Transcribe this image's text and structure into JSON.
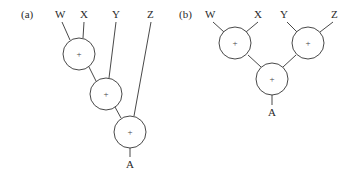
{
  "panels": [
    {
      "id": "a",
      "tag": "(a)",
      "tag_pos": [
        21,
        18
      ],
      "inputs": [
        {
          "label": "W",
          "x": 58,
          "y": 18
        },
        {
          "label": "X",
          "x": 83,
          "y": 18
        },
        {
          "label": "Y",
          "x": 115,
          "y": 18
        },
        {
          "label": "Z",
          "x": 150,
          "y": 18
        }
      ],
      "nodes": [
        {
          "id": "a1",
          "label": "+",
          "cx": 79,
          "cy": 54,
          "r": 16
        },
        {
          "id": "a2",
          "label": "+",
          "cx": 106,
          "cy": 94,
          "r": 16
        },
        {
          "id": "a3",
          "label": "+",
          "cx": 130,
          "cy": 132,
          "r": 16
        }
      ],
      "output": {
        "label": "A",
        "x": 130,
        "y": 168
      }
    },
    {
      "id": "b",
      "tag": "(b)",
      "tag_pos": [
        179,
        18
      ],
      "inputs": [
        {
          "label": "W",
          "x": 210,
          "y": 18
        },
        {
          "label": "X",
          "x": 258,
          "y": 18
        },
        {
          "label": "Y",
          "x": 283,
          "y": 18
        },
        {
          "label": "Z",
          "x": 334,
          "y": 18
        }
      ],
      "nodes": [
        {
          "id": "b1",
          "label": "+",
          "cx": 235,
          "cy": 43,
          "r": 16
        },
        {
          "id": "b2",
          "label": "+",
          "cx": 308,
          "cy": 43,
          "r": 16
        },
        {
          "id": "b3",
          "label": "+",
          "cx": 272,
          "cy": 79,
          "r": 16
        }
      ],
      "output": {
        "label": "A",
        "x": 272,
        "y": 116
      }
    }
  ]
}
